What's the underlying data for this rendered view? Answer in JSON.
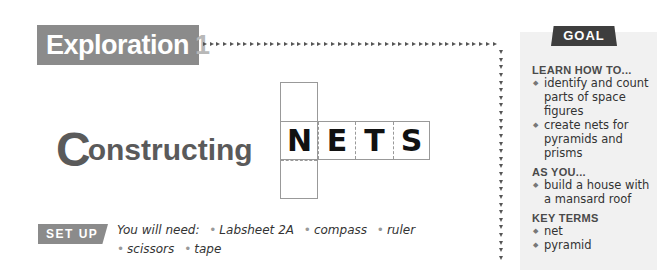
{
  "header": {
    "exploration_label": "Exploration",
    "exploration_number": "1"
  },
  "title": {
    "first_letter": "C",
    "rest": "onstructing",
    "net_letters": [
      "N",
      "E",
      "T",
      "S"
    ]
  },
  "setup": {
    "badge": "SET UP",
    "intro": "You will need:",
    "items": [
      "Labsheet 2A",
      "compass",
      "ruler",
      "scissors",
      "tape"
    ]
  },
  "goal": {
    "tab": "GOAL",
    "sections": [
      {
        "heading": "LEARN HOW TO...",
        "items": [
          "identify and count parts of space figures",
          "create nets for pyramids and prisms"
        ]
      },
      {
        "heading": "AS YOU...",
        "items": [
          "build a house with a mansard roof"
        ]
      },
      {
        "heading": "KEY TERMS",
        "items": [
          "net",
          "pyramid"
        ]
      }
    ]
  },
  "colors": {
    "banner_gray": "#8b8b8b",
    "goal_tab": "#3e3e3e",
    "goal_panel_bg": "#f1f1f1",
    "title_gray": "#5a5a5a"
  }
}
